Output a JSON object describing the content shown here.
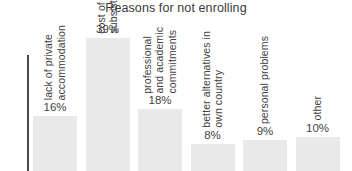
{
  "chart_data": {
    "type": "bar",
    "title": "Reasons for not enrolling",
    "xlabel": "",
    "ylabel": "",
    "grid": false,
    "legend": null,
    "axis": {
      "y_axis_visible": true,
      "x_axis_visible": false,
      "note": "plot is cropped at the bottom; only the upper portions of the bars are visible"
    },
    "categories": [
      "lack of private accommodation",
      "cost of travel and subsistence",
      "professional and academic commitments",
      "better alternatives in own country",
      "personal problems",
      "other"
    ],
    "category_lines": [
      [
        "lack of private",
        "accommodation"
      ],
      [
        "cost of travel and",
        "subsistence"
      ],
      [
        "professional",
        "and academic",
        "commitments"
      ],
      [
        "better alternatives in",
        "own country"
      ],
      [
        "personal problems"
      ],
      [
        "other"
      ]
    ],
    "values": [
      16,
      39,
      18,
      8,
      9,
      10
    ],
    "value_labels": [
      "16%",
      "39%",
      "18%",
      "8%",
      "9%",
      "10%"
    ],
    "ylim": [
      0,
      45
    ],
    "units": "%"
  },
  "style": {
    "bar_color": "#e9e9e9",
    "text_color": "#3f3f3f",
    "title_color": "#3a3a3a",
    "axis_color": "#4a4a4a",
    "background": "#ffffff"
  }
}
